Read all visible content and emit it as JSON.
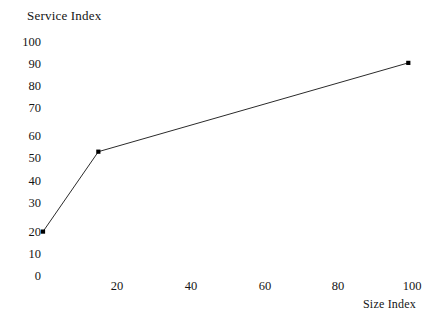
{
  "chart_data": {
    "type": "line",
    "title": "Service Index",
    "xlabel": "Size Index",
    "ylabel": "Service Index",
    "x": [
      0,
      15,
      99
    ],
    "values": [
      20,
      56,
      96
    ],
    "series": [
      {
        "name": "Service Index",
        "points": [
          {
            "x": 0,
            "y": 20
          },
          {
            "x": 15,
            "y": 56
          },
          {
            "x": 99,
            "y": 96
          }
        ]
      }
    ],
    "xlim": [
      0,
      100
    ],
    "ylim": [
      0,
      100
    ],
    "x_ticks": [
      "20",
      "40",
      "60",
      "80",
      "100"
    ],
    "x_tick_values": [
      20,
      40,
      60,
      80,
      100
    ],
    "y_ticks": [
      "100",
      "90",
      "80",
      "70",
      "60",
      "50",
      "40",
      "30",
      "20",
      "10",
      "0"
    ],
    "y_tick_values": [
      100,
      90,
      80,
      70,
      60,
      50,
      40,
      30,
      20,
      10,
      0
    ],
    "grid": false,
    "legend": false,
    "markers": "filled-square",
    "line_color": "#2b2b2b",
    "marker_color": "#000000",
    "background_color": "#ffffff"
  },
  "axes": {
    "y_ticks": [
      {
        "label": "100",
        "top": 35
      },
      {
        "label": "90",
        "top": 57
      },
      {
        "label": "80",
        "top": 79
      },
      {
        "label": "70",
        "top": 101
      },
      {
        "label": "60",
        "top": 129
      },
      {
        "label": "50",
        "top": 151
      },
      {
        "label": "40",
        "top": 174
      },
      {
        "label": "30",
        "top": 196
      },
      {
        "label": "20",
        "top": 225
      },
      {
        "label": "10",
        "top": 247
      },
      {
        "label": "0",
        "top": 269
      }
    ],
    "x_ticks": [
      {
        "label": "20",
        "left": 97
      },
      {
        "label": "40",
        "left": 171
      },
      {
        "label": "60",
        "left": 245
      },
      {
        "label": "80",
        "left": 318
      },
      {
        "label": "100",
        "left": 392
      }
    ]
  }
}
